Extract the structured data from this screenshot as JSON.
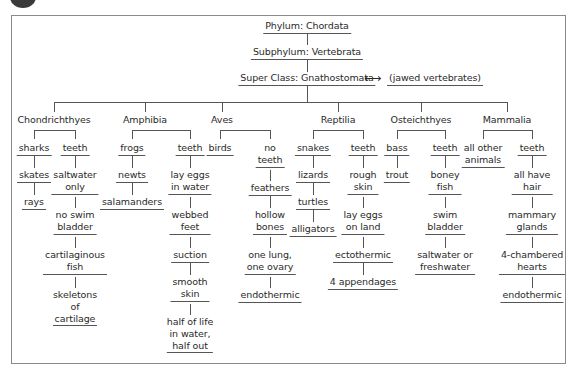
{
  "diagram": {
    "phylum": "Phylum: Chordata",
    "subphylum": "Subphylum: Vertebrata",
    "superclass": "Super Class: Gnathostomata",
    "arrow": "⟷",
    "superclass_note": "(jawed vertebrates)",
    "classes": [
      {
        "name": "Chondrichthyes",
        "left_branch": [
          "sharks",
          "skates",
          "rays"
        ],
        "right_branch": [
          "teeth",
          "saltwater only",
          "no swim bladder",
          "cartilaginous fish",
          "skeletons of cartilage"
        ]
      },
      {
        "name": "Amphibia",
        "left_branch": [
          "frogs",
          "newts",
          "salamanders"
        ],
        "right_branch": [
          "teeth",
          "lay eggs in water",
          "webbed feet",
          "suction",
          "smooth skin",
          "half of life in water, half out"
        ]
      },
      {
        "name": "Aves",
        "left_branch": [
          "birds"
        ],
        "right_branch": [
          "no teeth",
          "feathers",
          "hollow bones",
          "one lung, one ovary",
          "endothermic"
        ]
      },
      {
        "name": "Reptilia",
        "left_branch": [
          "snakes",
          "lizards",
          "turtles",
          "alligators"
        ],
        "right_branch": [
          "teeth",
          "rough skin",
          "lay eggs on land",
          "ectothermic",
          "4 appendages"
        ]
      },
      {
        "name": "Osteichthyes",
        "left_branch": [
          "bass",
          "trout"
        ],
        "right_branch": [
          "teeth",
          "boney fish",
          "swim bladder",
          "saltwater or freshwater"
        ]
      },
      {
        "name": "Mammalia",
        "left_branch": [
          "all other animals"
        ],
        "right_branch": [
          "teeth",
          "all have hair",
          "mammary glands",
          "4-chambered hearts",
          "endothermic"
        ]
      }
    ]
  },
  "lines": {
    "c0": [
      "sharks"
    ],
    "c1": [
      "teeth"
    ]
  },
  "text": {
    "c0l0": "sharks",
    "c0l1": "skates",
    "c0l2": "rays",
    "c0r0": "teeth",
    "c0r1a": "saltwater",
    "c0r1b": "only",
    "c0r2a": "no swim",
    "c0r2b": "bladder",
    "c0r3a": "cartilaginous",
    "c0r3b": "fish",
    "c0r4a": "skeletons",
    "c0r4b": "of",
    "c0r4c": "cartilage",
    "c1l0": "frogs",
    "c1l1": "newts",
    "c1l2": "salamanders",
    "c1r0": "teeth",
    "c1r1a": "lay eggs",
    "c1r1b": "in water",
    "c1r2a": "webbed",
    "c1r2b": "feet",
    "c1r3": "suction",
    "c1r4a": "smooth",
    "c1r4b": "skin",
    "c1r5a": "half of life",
    "c1r5b": "in water,",
    "c1r5c": "half out",
    "c2l0": "birds",
    "c2r0a": "no",
    "c2r0b": "teeth",
    "c2r1": "feathers",
    "c2r2a": "hollow",
    "c2r2b": "bones",
    "c2r3a": "one lung,",
    "c2r3b": "one ovary",
    "c2r4": "endothermic",
    "c3l0": "snakes",
    "c3l1": "lizards",
    "c3l2": "turtles",
    "c3l3": "alligators",
    "c3r0": "teeth",
    "c3r1a": "rough",
    "c3r1b": "skin",
    "c3r2a": "lay eggs",
    "c3r2b": "on land",
    "c3r3": "ectothermic",
    "c3r4": "4 appendages",
    "c4l0": "bass",
    "c4l1": "trout",
    "c4r0": "teeth",
    "c4r1a": "boney",
    "c4r1b": "fish",
    "c4r2a": "swim",
    "c4r2b": "bladder",
    "c4r3a": "saltwater or",
    "c4r3b": "freshwater",
    "c5l0a": "all other",
    "c5l0b": "animals",
    "c5r0": "teeth",
    "c5r1a": "all have",
    "c5r1b": "hair",
    "c5r2a": "mammary",
    "c5r2b": "glands",
    "c5r3a": "4-chambered",
    "c5r3b": "hearts",
    "c5r4": "endothermic"
  }
}
